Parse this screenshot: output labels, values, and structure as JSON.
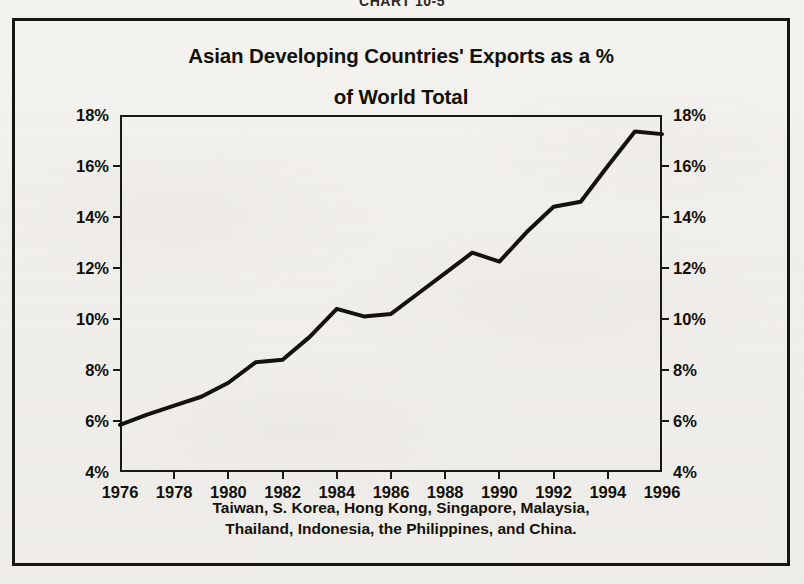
{
  "page": {
    "chart_number": "CHART 10-5"
  },
  "figure": {
    "title_line1": "Asian Developing Countries' Exports as a %",
    "title_line2": "of World Total",
    "footnote_line1": "Taiwan, S. Korea, Hong Kong, Singapore, Malaysia,",
    "footnote_line2": "Thailand, Indonesia, the Philippines, and China."
  },
  "chart_data": {
    "type": "line",
    "title": "Asian Developing Countries' Exports as a % of World Total",
    "subtitle": "",
    "xlabel": "",
    "ylabel": "",
    "x": [
      1976,
      1977,
      1978,
      1979,
      1980,
      1981,
      1982,
      1983,
      1984,
      1985,
      1986,
      1987,
      1988,
      1989,
      1990,
      1991,
      1992,
      1993,
      1994,
      1995,
      1996
    ],
    "values": [
      5.85,
      6.25,
      6.6,
      6.95,
      7.5,
      8.3,
      8.4,
      9.3,
      10.4,
      10.1,
      10.2,
      11.0,
      11.8,
      12.6,
      12.25,
      13.4,
      14.4,
      14.6,
      16.0,
      17.35,
      17.25
    ],
    "series": [
      {
        "name": "Asian developing countries' exports as % of world total",
        "values": [
          5.85,
          6.25,
          6.6,
          6.95,
          7.5,
          8.3,
          8.4,
          9.3,
          10.4,
          10.1,
          10.2,
          11.0,
          11.8,
          12.6,
          12.25,
          13.4,
          14.4,
          14.6,
          16.0,
          17.35,
          17.25
        ]
      }
    ],
    "xlim": [
      1976,
      1996
    ],
    "ylim": [
      4,
      18
    ],
    "y_ticks": [
      4,
      6,
      8,
      10,
      12,
      14,
      16,
      18
    ],
    "y_tick_labels": [
      "4%",
      "6%",
      "8%",
      "10%",
      "12%",
      "14%",
      "16%",
      "18%"
    ],
    "y_axis_right_labels": [
      "4%",
      "6%",
      "8%",
      "10%",
      "12%",
      "14%",
      "16%",
      "18%"
    ],
    "x_ticks": [
      1976,
      1978,
      1980,
      1982,
      1984,
      1986,
      1988,
      1990,
      1992,
      1994,
      1996
    ],
    "x_tick_labels": [
      "1976",
      "1978",
      "1980",
      "1982",
      "1984",
      "1986",
      "1988",
      "1990",
      "1992",
      "1994",
      "1996"
    ],
    "grid": false,
    "legend": false,
    "line_color": "#14120c",
    "line_width": 4,
    "annotation": "Taiwan, S. Korea, Hong Kong, Singapore, Malaysia, Thailand, Indonesia, the Philippines, and China."
  },
  "colors": {
    "ink": "#14120c",
    "paper": "#f2f0ec",
    "frame": "#17150f"
  }
}
